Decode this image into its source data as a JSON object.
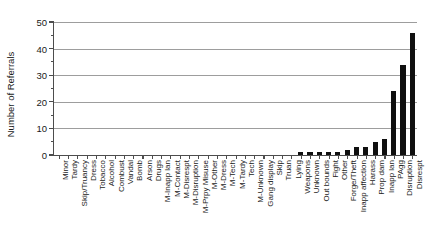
{
  "chart_data": {
    "type": "bar",
    "title": "",
    "xlabel": "",
    "ylabel": "Number of Referrals",
    "ylim": [
      0,
      50
    ],
    "yticks": [
      0,
      10,
      20,
      30,
      40,
      50
    ],
    "ytick_labels": [
      "0",
      "10",
      "20",
      "30",
      "40",
      "50"
    ],
    "y_minor_ticks": [
      5,
      15,
      25,
      35,
      45
    ],
    "grid": "horizontal",
    "legend": "none",
    "bar_color": "#101010",
    "axis_color": "#4d4d4d",
    "grid_color": "#8c8c8c",
    "categories": [
      "Minor",
      "Tardy",
      "Skip/Truancy",
      "Dress",
      "Tobacco",
      "Alcohol",
      "Combust",
      "Vandal",
      "Bomb",
      "Arson",
      "Drugs",
      "M-Inapp lan",
      "M-Contact",
      "M-Disrespt",
      "M-Disruption",
      "M-Prpy Misuse",
      "M-Other",
      "M-Dress",
      "M-Tech",
      "M-Tardy",
      "Tech",
      "M-Unknown",
      "Gang display",
      "Skip",
      "Truan",
      "Lying",
      "Weapons",
      "Unknown",
      "Out bounds",
      "Fight",
      "Other",
      "Forge/Theft",
      "Inapp affection",
      "Harass",
      "Prop dam",
      "Inapp lan",
      "PAgg",
      "Disruption",
      "Disrespt"
    ],
    "values": [
      0,
      0,
      0,
      0,
      0,
      0,
      0,
      0,
      0,
      0,
      0,
      0,
      0,
      0,
      0,
      0,
      0,
      0,
      0,
      0,
      0,
      0,
      0,
      0,
      0,
      0,
      1,
      1,
      1,
      1,
      1,
      2,
      3,
      3,
      5,
      6,
      6,
      8,
      9
    ],
    "values_note": "tail bars read off gridlines",
    "tail_override": {
      "PAgg": 24,
      "Disruption": 34,
      "Disrespt": 46
    }
  }
}
